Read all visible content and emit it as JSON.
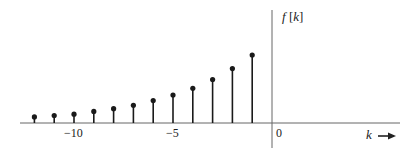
{
  "chart_data": {
    "type": "stem",
    "title": "",
    "ylabel": "f[k]",
    "xlabel": "k",
    "x": [
      -12,
      -11,
      -10,
      -9,
      -8,
      -7,
      -6,
      -5,
      -4,
      -3,
      -2,
      -1
    ],
    "values": [
      0.09,
      0.11,
      0.13,
      0.17,
      0.21,
      0.26,
      0.33,
      0.41,
      0.51,
      0.64,
      0.8,
      1.0
    ],
    "x_tick_labels": [
      "−10",
      "−5",
      "0"
    ],
    "x_tick_positions": [
      -10,
      -5,
      0
    ],
    "xlim": [
      -13,
      7
    ],
    "ylim": [
      0,
      1.25
    ],
    "grid": false,
    "legend": null
  },
  "labels": {
    "ylabel_f": "f",
    "ylabel_bracket": "[",
    "ylabel_k": "k",
    "ylabel_bracket_close": "]",
    "xlabel": "k",
    "tick_m10": "−10",
    "tick_m5": "−5",
    "tick_0": "0"
  },
  "colors": {
    "ink": "#1a1a1a",
    "axis": "#555555"
  }
}
